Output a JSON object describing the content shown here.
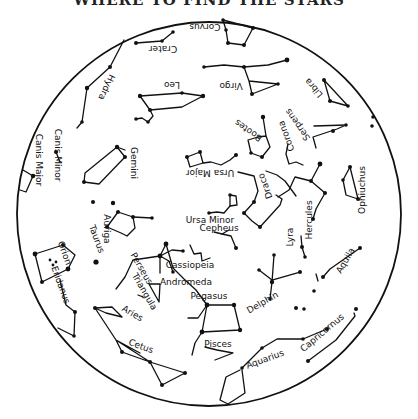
{
  "title": "WHERE TO FIND THE STARS",
  "chart": {
    "circle": {
      "cx": 209,
      "cy": 214,
      "r": 192
    },
    "labels": [
      {
        "name": "Corvus",
        "x": 205,
        "y": 24,
        "rot": 180
      },
      {
        "name": "Crater",
        "x": 163,
        "y": 46,
        "rot": 180
      },
      {
        "name": "Hydra",
        "x": 104,
        "y": 86,
        "rot": 115
      },
      {
        "name": "Leo",
        "x": 172,
        "y": 82,
        "rot": 180
      },
      {
        "name": "Virgo",
        "x": 231,
        "y": 83,
        "rot": 180
      },
      {
        "name": "Libra",
        "x": 316,
        "y": 86,
        "rot": 230
      },
      {
        "name": "Serpens",
        "x": 300,
        "y": 123,
        "rot": 235
      },
      {
        "name": "Corona",
        "x": 289,
        "y": 135,
        "rot": 250
      },
      {
        "name": "Bootes",
        "x": 250,
        "y": 128,
        "rot": 215
      },
      {
        "name": "Ophiuchus",
        "x": 365,
        "y": 190,
        "rot": 270
      },
      {
        "name": "Hercules",
        "x": 312,
        "y": 220,
        "rot": 270
      },
      {
        "name": "Draco",
        "x": 268,
        "y": 185,
        "rot": 250
      },
      {
        "name": "Ursa Major",
        "x": 210,
        "y": 170,
        "rot": 180
      },
      {
        "name": "Ursa Minor",
        "x": 210,
        "y": 223,
        "rot": 0
      },
      {
        "name": "Cepheus",
        "x": 219,
        "y": 231,
        "rot": 0
      },
      {
        "name": "Lyra",
        "x": 293,
        "y": 237,
        "rot": 270
      },
      {
        "name": "Aquila",
        "x": 348,
        "y": 262,
        "rot": 300
      },
      {
        "name": "Cassiopeia",
        "x": 190,
        "y": 268,
        "rot": 0
      },
      {
        "name": "Andromeda",
        "x": 186,
        "y": 285,
        "rot": 0
      },
      {
        "name": "Pegasus",
        "x": 209,
        "y": 299,
        "rot": 0
      },
      {
        "name": "Delphin",
        "x": 264,
        "y": 305,
        "rot": 330
      },
      {
        "name": "Capricornus",
        "x": 324,
        "y": 335,
        "rot": 320
      },
      {
        "name": "Aquarius",
        "x": 266,
        "y": 362,
        "rot": 340
      },
      {
        "name": "Pisces",
        "x": 218,
        "y": 347,
        "rot": 0
      },
      {
        "name": "Cetus",
        "x": 140,
        "y": 349,
        "rot": 20
      },
      {
        "name": "Aries",
        "x": 131,
        "y": 316,
        "rot": 30
      },
      {
        "name": "Triangula",
        "x": 142,
        "y": 293,
        "rot": 60
      },
      {
        "name": "Perseus",
        "x": 139,
        "y": 270,
        "rot": 60
      },
      {
        "name": "Taurus",
        "x": 94,
        "y": 240,
        "rot": 70
      },
      {
        "name": "Auriga",
        "x": 104,
        "y": 229,
        "rot": 90
      },
      {
        "name": "Gemini",
        "x": 131,
        "y": 163,
        "rot": 90
      },
      {
        "name": "Orion",
        "x": 62,
        "y": 254,
        "rot": 70
      },
      {
        "name": "Eridanus",
        "x": 58,
        "y": 286,
        "rot": 70
      },
      {
        "name": "Canis Minor",
        "x": 55,
        "y": 155,
        "rot": 90
      },
      {
        "name": "Canis Major",
        "x": 36,
        "y": 160,
        "rot": 90
      }
    ]
  }
}
